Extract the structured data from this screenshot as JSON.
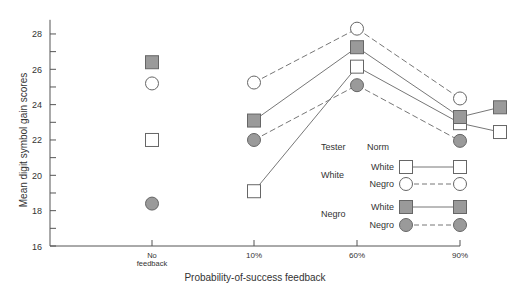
{
  "chart_data": {
    "type": "line",
    "title": "",
    "xlabel": "Probability-of-success feedback",
    "ylabel": "Mean digit symbol gain scores",
    "categories": [
      "No feedback",
      "10%",
      "60%",
      "90%"
    ],
    "ylim": [
      16,
      28.8
    ],
    "yticks": [
      16,
      18,
      20,
      22,
      24,
      26,
      28
    ],
    "grid": false,
    "series": [
      {
        "name": "White tester / White norm",
        "tester": "White",
        "norm": "White",
        "marker": "open-square",
        "line": "solid",
        "values": [
          22.0,
          19.1,
          26.15,
          22.95
        ],
        "extra_point": 22.45
      },
      {
        "name": "White tester / Negro norm",
        "tester": "White",
        "norm": "Negro",
        "marker": "open-circle",
        "line": "dashed",
        "values": [
          25.2,
          25.25,
          28.3,
          24.35
        ]
      },
      {
        "name": "Negro tester / White norm",
        "tester": "Negro",
        "norm": "White",
        "marker": "filled-square",
        "line": "solid",
        "values": [
          26.4,
          23.1,
          27.25,
          23.3
        ],
        "extra_point": 23.85
      },
      {
        "name": "Negro tester / Negro norm",
        "tester": "Negro",
        "norm": "Negro",
        "marker": "filled-circle",
        "line": "dashed",
        "values": [
          18.4,
          22.0,
          25.1,
          21.95
        ]
      }
    ],
    "legend": {
      "position": "inside-lower-right",
      "header_tester": "Tester",
      "header_norm": "Norm",
      "groups": [
        {
          "tester": "White",
          "rows": [
            {
              "norm": "White",
              "marker": "open-square",
              "line": "solid"
            },
            {
              "norm": "Negro",
              "marker": "open-circle",
              "line": "dashed"
            }
          ]
        },
        {
          "tester": "Negro",
          "rows": [
            {
              "norm": "White",
              "marker": "filled-square",
              "line": "solid"
            },
            {
              "norm": "Negro",
              "marker": "filled-circle",
              "line": "dashed"
            }
          ]
        }
      ]
    }
  },
  "axis": {
    "x_tick_labels": [
      "No",
      "feedback",
      "10%",
      "60%",
      "90%"
    ]
  },
  "colors": {
    "axis": "#555555",
    "marker_stroke": "#666666",
    "marker_fill": "#9a9a9a",
    "line": "#777777"
  }
}
